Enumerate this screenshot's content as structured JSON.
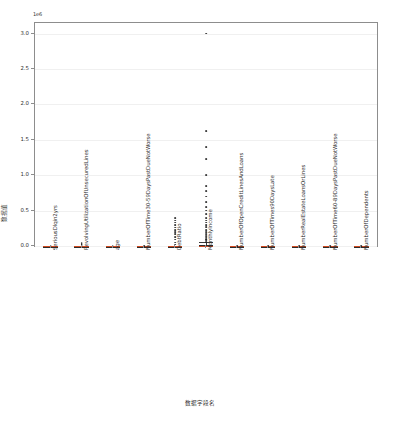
{
  "chart_data": {
    "type": "bar",
    "plot_kind": "box",
    "title": "",
    "xlabel": "数据字段名",
    "ylabel": "数据值",
    "y_offset_text": "1e6",
    "ylim": [
      0,
      3.15
    ],
    "y_scale_multiplier": 1000000,
    "yticks": [
      0.0,
      0.5,
      1.0,
      1.5,
      2.0,
      2.5,
      3.0
    ],
    "ytick_labels": [
      "0.0",
      "0.5",
      "1.0",
      "1.5",
      "2.0",
      "2.5",
      "3.0"
    ],
    "grid": false,
    "legend": "none",
    "categories": [
      "SeriousDlqin2yrs",
      "RevolvingUtilizationOfUnsecuredLines",
      "age",
      "NumberOfTime30-59DaysPastDueNotWorse",
      "DebtRatio",
      "MonthlyIncome",
      "NumberOfOpenCreditLinesAndLoans",
      "NumberOfTimes90DaysLate",
      "NumberRealEstateLoansOrLines",
      "NumberOfTime60-89DaysPastDueNotWorse",
      "NumberOfDependents"
    ],
    "series": [
      {
        "name": "SeriousDlqin2yrs",
        "q1": 0.0,
        "median": 0.0,
        "q3": 0.0,
        "whisker_low": 0.0,
        "whisker_high": 0.0,
        "fliers": [
          0.0
        ]
      },
      {
        "name": "RevolvingUtilizationOfUnsecuredLines",
        "q1": 0.0,
        "median": 0.0,
        "q3": 0.0,
        "whisker_low": 0.0,
        "whisker_high": 0.0,
        "fliers": [
          0.0,
          0.01,
          0.02,
          0.03,
          0.04
        ]
      },
      {
        "name": "age",
        "q1": 0.0,
        "median": 0.0,
        "q3": 0.0,
        "whisker_low": 0.0,
        "whisker_high": 0.0,
        "fliers": [
          0.0
        ]
      },
      {
        "name": "NumberOfTime30-59DaysPastDueNotWorse",
        "q1": 0.0,
        "median": 0.0,
        "q3": 0.0,
        "whisker_low": 0.0,
        "whisker_high": 0.0,
        "fliers": [
          0.0
        ]
      },
      {
        "name": "DebtRatio",
        "q1": 0.0,
        "median": 0.0,
        "q3": 0.0,
        "whisker_low": 0.0,
        "whisker_high": 0.0,
        "fliers": [
          0.02,
          0.05,
          0.09,
          0.13,
          0.17,
          0.2,
          0.23,
          0.26,
          0.3,
          0.33,
          0.36,
          0.4
        ]
      },
      {
        "name": "MonthlyIncome",
        "q1": 0.0,
        "median": 0.0,
        "q3": 0.02,
        "whisker_low": 0.0,
        "whisker_high": 0.05,
        "fliers": [
          0.06,
          0.08,
          0.1,
          0.12,
          0.14,
          0.17,
          0.2,
          0.23,
          0.27,
          0.3,
          0.33,
          0.36,
          0.4,
          0.45,
          0.5,
          0.55,
          0.62,
          0.7,
          0.78,
          0.85,
          1.0,
          1.23,
          1.4,
          1.62,
          3.0
        ]
      },
      {
        "name": "NumberOfOpenCreditLinesAndLoans",
        "q1": 0.0,
        "median": 0.0,
        "q3": 0.0,
        "whisker_low": 0.0,
        "whisker_high": 0.0,
        "fliers": [
          0.0
        ]
      },
      {
        "name": "NumberOfTimes90DaysLate",
        "q1": 0.0,
        "median": 0.0,
        "q3": 0.0,
        "whisker_low": 0.0,
        "whisker_high": 0.0,
        "fliers": [
          0.0
        ]
      },
      {
        "name": "NumberRealEstateLoansOrLines",
        "q1": 0.0,
        "median": 0.0,
        "q3": 0.0,
        "whisker_low": 0.0,
        "whisker_high": 0.0,
        "fliers": [
          0.0
        ]
      },
      {
        "name": "NumberOfTime60-89DaysPastDueNotWorse",
        "q1": 0.0,
        "median": 0.0,
        "q3": 0.0,
        "whisker_low": 0.0,
        "whisker_high": 0.0,
        "fliers": [
          0.0
        ]
      },
      {
        "name": "NumberOfDependents",
        "q1": 0.0,
        "median": 0.0,
        "q3": 0.0,
        "whisker_low": 0.0,
        "whisker_high": 0.0,
        "fliers": [
          0.0
        ]
      }
    ],
    "colors": {
      "box_edge": "#2b2b2b",
      "median": "#d1491f",
      "flier": "#1d1d1d",
      "whisker": "#3a3a3a",
      "frame": "#8d8d8d",
      "background": "#ffffff"
    }
  }
}
